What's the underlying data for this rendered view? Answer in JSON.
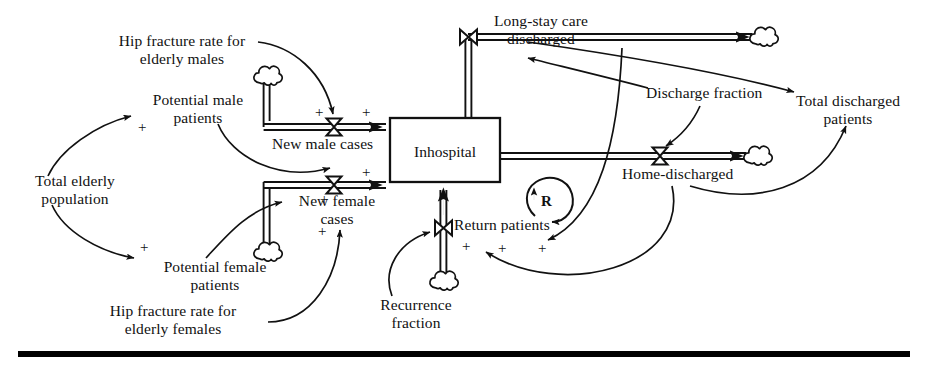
{
  "diagram": {
    "type": "stock-and-flow system dynamics diagram",
    "title": "",
    "stocks": [
      {
        "id": "inhospital",
        "label": "Inhospital",
        "x": 390,
        "y": 118,
        "w": 110,
        "h": 64
      }
    ],
    "flows": [
      {
        "id": "new-male-cases",
        "label": "New male cases",
        "valve_x": 334,
        "valve_y": 127,
        "orientation": "vertical-bowtie"
      },
      {
        "id": "new-female-cases",
        "label": "New female\ncases",
        "valve_x": 334,
        "valve_y": 185,
        "orientation": "vertical-bowtie"
      },
      {
        "id": "long-stay-care-discharged",
        "label": "Long-stay care\ndischarged",
        "valve_x": 468,
        "valve_y": 37,
        "orientation": "horizontal-bowtie"
      },
      {
        "id": "home-discharged",
        "label": "Home-discharged",
        "valve_x": 660,
        "valve_y": 156,
        "orientation": "vertical-bowtie"
      },
      {
        "id": "return-patients",
        "label": "Return patients",
        "valve_x": 444,
        "valve_y": 228,
        "orientation": "horizontal-bowtie"
      }
    ],
    "auxiliaries": [
      {
        "id": "hip-fracture-rate-elderly-males",
        "label": "Hip fracture rate for\nelderly males"
      },
      {
        "id": "potential-male-patients",
        "label": "Potential male\npatients"
      },
      {
        "id": "total-elderly-population",
        "label": "Total elderly\npopulation"
      },
      {
        "id": "potential-female-patients",
        "label": "Potential female\npatients"
      },
      {
        "id": "hip-fracture-rate-elderly-females",
        "label": "Hip fracture rate for\nelderly females"
      },
      {
        "id": "recurrence-fraction",
        "label": "Recurrence\nfraction"
      },
      {
        "id": "discharge-fraction",
        "label": "Discharge fraction"
      },
      {
        "id": "total-discharged-patients",
        "label": "Total discharged\npatients"
      }
    ],
    "loops": [
      {
        "id": "reinforcing-loop",
        "label": "R",
        "polarity": "reinforcing",
        "cx": 547,
        "cy": 201
      }
    ],
    "polarity_signs": [
      {
        "id": "sign-total-elderly-to-male",
        "label": "+",
        "x": 140,
        "y": 120
      },
      {
        "id": "sign-hipfrac-male-to-flow",
        "label": "+",
        "x": 317,
        "y": 106
      },
      {
        "id": "sign-male-flow-to-stock",
        "label": "+",
        "x": 364,
        "y": 105
      },
      {
        "id": "sign-total-elderly-to-female",
        "label": "+",
        "x": 142,
        "y": 240
      },
      {
        "id": "sign-potential-female-to-flow",
        "label": "+",
        "x": 322,
        "y": 191
      },
      {
        "id": "sign-female-flow-to-stock",
        "label": "+",
        "x": 364,
        "y": 172
      },
      {
        "id": "sign-hipfrac-female-to-flow",
        "label": "+",
        "x": 320,
        "y": 225
      },
      {
        "id": "sign-recurrence-to-return",
        "label": "+",
        "x": 464,
        "y": 240
      },
      {
        "id": "sign-return-left",
        "label": "+",
        "x": 500,
        "y": 242
      },
      {
        "id": "sign-return-right",
        "label": "+",
        "x": 540,
        "y": 242
      }
    ],
    "clouds": [
      {
        "id": "cloud-male-source",
        "x": 267,
        "y": 78
      },
      {
        "id": "cloud-female-source",
        "x": 267,
        "y": 252
      },
      {
        "id": "cloud-recurrence-source",
        "x": 443,
        "y": 281
      },
      {
        "id": "cloud-longstay-sink",
        "x": 761,
        "y": 37
      },
      {
        "id": "cloud-home-sink",
        "x": 755,
        "y": 156
      }
    ],
    "labels": {
      "hip_fracture_males_l1": "Hip fracture rate for",
      "hip_fracture_males_l2": "elderly males",
      "potential_male_l1": "Potential male",
      "potential_male_l2": "patients",
      "total_elderly_l1": "Total elderly",
      "total_elderly_l2": "population",
      "potential_female_l1": "Potential female",
      "potential_female_l2": "patients",
      "hip_fracture_females_l1": "Hip fracture rate for",
      "hip_fracture_females_l2": "elderly females",
      "new_male_cases": "New male cases",
      "new_female_cases_l1": "New female",
      "new_female_cases_l2": "cases",
      "inhospital": "Inhospital",
      "long_stay_l1": "Long-stay care",
      "long_stay_l2": "discharged",
      "discharge_fraction": "Discharge fraction",
      "total_discharged_l1": "Total discharged",
      "total_discharged_l2": "patients",
      "home_discharged": "Home-discharged",
      "return_patients": "Return patients",
      "recurrence_l1": "Recurrence",
      "recurrence_l2": "fraction",
      "loop_r": "R"
    },
    "colors": {
      "ink": "#111111",
      "background": "#ffffff",
      "rule": "#000000"
    }
  }
}
